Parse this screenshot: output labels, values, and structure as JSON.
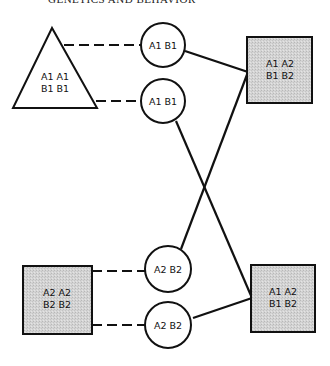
{
  "header": {
    "running_title": "GENETICS AND BEHAVIOR"
  },
  "diagram": {
    "type": "genetic-cross-pedigree",
    "colors": {
      "stroke": "#111111",
      "fill_shaded": "#d6d6d6",
      "fill_plain": "#ffffff"
    },
    "parents": {
      "triangle": {
        "line1": "A1 A1",
        "line2": "B1 B1"
      },
      "square_bottom_left": {
        "line1": "A2 A2",
        "line2": "B2 B2"
      }
    },
    "gametes": [
      {
        "id": "g1",
        "label": "A1 B1"
      },
      {
        "id": "g2",
        "label": "A1 B1"
      },
      {
        "id": "g3",
        "label": "A2 B2"
      },
      {
        "id": "g4",
        "label": "A2 B2"
      }
    ],
    "offspring": {
      "square_top_right": {
        "line1": "A1 A2",
        "line2": "B1 B2"
      },
      "square_bottom_right": {
        "line1": "A1 A2",
        "line2": "B1 B2"
      }
    },
    "connections": [
      {
        "from": "triangle",
        "to": "g1",
        "style": "dashed"
      },
      {
        "from": "triangle",
        "to": "g2",
        "style": "dashed"
      },
      {
        "from": "square_bottom_left",
        "to": "g3",
        "style": "dashed"
      },
      {
        "from": "square_bottom_left",
        "to": "g4",
        "style": "dashed"
      },
      {
        "from": "g1",
        "to": "square_top_right",
        "style": "solid"
      },
      {
        "from": "g3",
        "to": "square_top_right",
        "style": "solid"
      },
      {
        "from": "g2",
        "to": "square_bottom_right",
        "style": "solid"
      },
      {
        "from": "g4",
        "to": "square_bottom_right",
        "style": "solid"
      }
    ]
  }
}
